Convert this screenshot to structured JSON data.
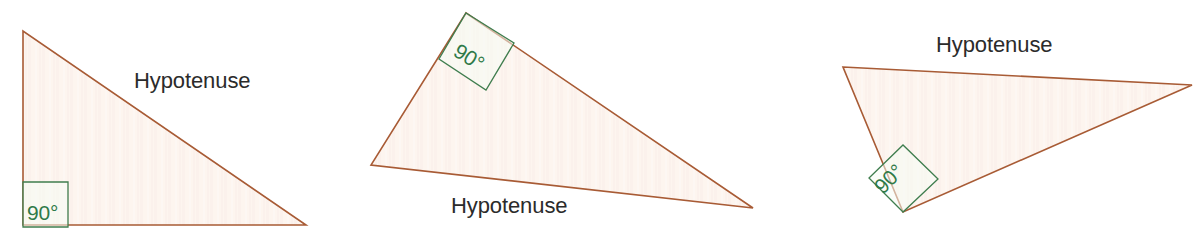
{
  "figure": {
    "background_color": "#ffffff",
    "stroke_color": "#a85b35",
    "fill_color": "#fdf4ee",
    "angle_color": "#2f7a48",
    "label_color": "#2b2b2b",
    "triangles": [
      {
        "id": "triangle-1",
        "orientation": "right angle at bottom-left",
        "hypotenuse_label": "Hypotenuse",
        "angle_label": "90°",
        "points": "23,31 23,225 306,225",
        "angle_box": "23,182 68,182 68,227 23,227",
        "angle_text_x": 27,
        "angle_text_y": 220
      },
      {
        "id": "triangle-2",
        "orientation": "right angle at top-left, rotated",
        "hypotenuse_label": "Hypotenuse",
        "angle_label": "90°",
        "points": "466,13 371,165 753,208",
        "angle_box": "466,13 514,43 486,90 439,59",
        "angle_text_x": 452,
        "angle_text_y": 55
      },
      {
        "id": "triangle-3",
        "orientation": "right angle at bottom-left, rotated",
        "hypotenuse_label": "Hypotenuse",
        "angle_label": "90°",
        "points": "843,67 1192,85 903,212",
        "angle_box": "903,212 869,178 903,145 938,179",
        "angle_text_x": 883,
        "angle_text_y": 195
      }
    ]
  }
}
